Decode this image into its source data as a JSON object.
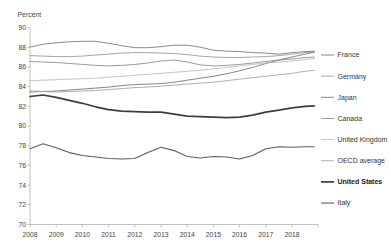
{
  "style": {
    "background": "#ffffff",
    "axis_color": "#b2b2b2",
    "text_color": "#3f3f3f"
  },
  "chart_data": {
    "type": "line",
    "title": "",
    "ylabel": "Percent",
    "xlabel": "",
    "ylim": [
      70,
      90
    ],
    "ytick_step": 2,
    "grid": false,
    "legend_position": "right",
    "x_start": 2008,
    "x_end_data": 2018.85,
    "xticks": [
      2008,
      2009,
      2010,
      2011,
      2012,
      2013,
      2014,
      2015,
      2016,
      2017,
      2018
    ],
    "x": [
      2008,
      2008.5,
      2009,
      2009.5,
      2010,
      2010.5,
      2011,
      2011.5,
      2012,
      2012.5,
      2013,
      2013.5,
      2014,
      2014.5,
      2015,
      2015.5,
      2016,
      2016.5,
      2017,
      2017.5,
      2018,
      2018.5,
      2018.85
    ],
    "series": [
      {
        "name": "France",
        "color": "#7d7d7d",
        "width": 0.9,
        "bold": false,
        "values": [
          88.0,
          88.3,
          88.45,
          88.55,
          88.6,
          88.6,
          88.4,
          88.15,
          87.95,
          87.95,
          88.05,
          88.2,
          88.2,
          88.0,
          87.7,
          87.6,
          87.55,
          87.45,
          87.4,
          87.3,
          87.45,
          87.55,
          87.6
        ]
      },
      {
        "name": "Germany",
        "color": "#9c9c9c",
        "width": 0.9,
        "bold": false,
        "values": [
          87.15,
          87.1,
          87.05,
          87.05,
          87.1,
          87.2,
          87.3,
          87.4,
          87.45,
          87.45,
          87.4,
          87.35,
          87.25,
          87.1,
          87.0,
          86.95,
          86.95,
          87.0,
          87.05,
          87.15,
          87.3,
          87.45,
          87.5
        ]
      },
      {
        "name": "Japan",
        "color": "#787878",
        "width": 0.9,
        "bold": false,
        "values": [
          83.45,
          83.5,
          83.55,
          83.65,
          83.75,
          83.85,
          83.95,
          84.1,
          84.2,
          84.25,
          84.3,
          84.45,
          84.65,
          84.85,
          85.05,
          85.3,
          85.6,
          85.95,
          86.35,
          86.7,
          87.0,
          87.3,
          87.5
        ]
      },
      {
        "name": "Canada",
        "color": "#8e8e8e",
        "width": 0.9,
        "bold": false,
        "values": [
          86.55,
          86.5,
          86.45,
          86.35,
          86.25,
          86.15,
          86.1,
          86.15,
          86.25,
          86.4,
          86.6,
          86.7,
          86.5,
          86.2,
          86.1,
          86.15,
          86.25,
          86.4,
          86.55,
          86.7,
          86.8,
          86.95,
          87.0
        ]
      },
      {
        "name": "United Kingdom",
        "color": "#b8b8b8",
        "width": 0.8,
        "bold": false,
        "values": [
          84.6,
          84.65,
          84.7,
          84.75,
          84.8,
          84.85,
          84.95,
          85.05,
          85.15,
          85.25,
          85.35,
          85.45,
          85.55,
          85.65,
          85.8,
          85.95,
          86.1,
          86.25,
          86.4,
          86.5,
          86.6,
          86.75,
          86.85
        ]
      },
      {
        "name": "OECD average",
        "color": "#a4a4a4",
        "width": 0.9,
        "bold": false,
        "values": [
          83.55,
          83.5,
          83.45,
          83.5,
          83.55,
          83.6,
          83.7,
          83.8,
          83.9,
          83.95,
          84.05,
          84.15,
          84.25,
          84.35,
          84.45,
          84.6,
          84.75,
          84.9,
          85.05,
          85.2,
          85.35,
          85.55,
          85.65
        ]
      },
      {
        "name": "United States",
        "color": "#3e3e3e",
        "width": 1.7,
        "bold": true,
        "values": [
          83.0,
          83.15,
          82.9,
          82.6,
          82.3,
          81.95,
          81.65,
          81.5,
          81.45,
          81.4,
          81.4,
          81.2,
          81.0,
          80.95,
          80.9,
          80.85,
          80.9,
          81.1,
          81.4,
          81.6,
          81.85,
          82.0,
          82.05
        ]
      },
      {
        "name": "Italy",
        "color": "#5c5c5c",
        "width": 1.1,
        "bold": false,
        "values": [
          77.7,
          78.2,
          77.8,
          77.3,
          77.0,
          76.85,
          76.7,
          76.65,
          76.7,
          77.3,
          77.85,
          77.5,
          76.9,
          76.75,
          76.9,
          76.85,
          76.65,
          77.0,
          77.7,
          77.9,
          77.85,
          77.9,
          77.9
        ]
      }
    ]
  }
}
